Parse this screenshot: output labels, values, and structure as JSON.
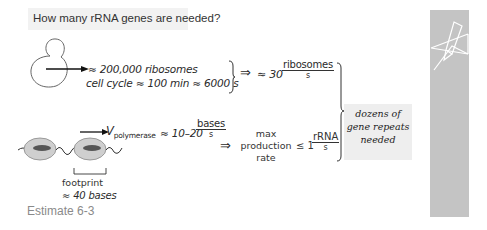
{
  "header": {
    "question": "How many rRNA genes are needed?"
  },
  "cell_row": {
    "ribosomes": "≈ 200,000 ribosomes",
    "cell_cycle": "cell cycle ≈ 100 min ≈ 6000 s",
    "implies": "⇒",
    "rate_prefix": "≈ 30",
    "rate_num": "ribosomes",
    "rate_den": "s"
  },
  "polymerase_row": {
    "v_symbol": "V",
    "v_sub": "polymerase",
    "speed_prefix": "≈ 10–20",
    "speed_num": "bases",
    "speed_den": "s",
    "implies": "⇒",
    "max_label_line1": "max",
    "max_label_line2": "production",
    "max_label_line3": "rate",
    "leq": "≤ 1",
    "prod_num": "rRNA",
    "prod_den": "s",
    "footprint_line1": "footprint",
    "footprint_line2": "≈ 40 bases"
  },
  "conclusion": {
    "line1": "dozens of",
    "line2": "gene repeats",
    "line3": "needed"
  },
  "caption": "Estimate 6-3",
  "colors": {
    "sidebar": "#c4c4c4",
    "callout_bg": "#eeeeee",
    "header_bg": "#f2f2f2",
    "caption": "#8a8a8a",
    "ink": "#2a2a2a"
  },
  "icons": {
    "sidebar_icon": "pencil-and-paper-icon",
    "cell": "yeast-cell-budding-icon",
    "polymerase": "rna-polymerase-on-dna-icon"
  }
}
